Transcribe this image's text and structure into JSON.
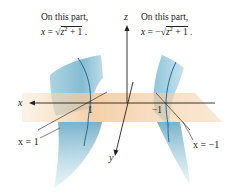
{
  "diagram": {
    "captions": {
      "left": {
        "line1": "On this part,",
        "lhs": "x",
        "eq": " = ",
        "sign": "",
        "radicand_var": "z",
        "radicand_exp": "2",
        "radicand_rest": " + 1",
        "end": " ."
      },
      "right": {
        "line1": "On this part,",
        "lhs": "x",
        "eq": " = ",
        "sign": "−",
        "radicand_var": "z",
        "radicand_exp": "2",
        "radicand_rest": " + 1",
        "end": " ."
      }
    },
    "axes": {
      "x_label": "x",
      "y_label": "y",
      "z_label": "z"
    },
    "ticks": {
      "pos_one": "1",
      "neg_one": "−1"
    },
    "callouts": {
      "left": "x = 1",
      "right": "x = −1"
    },
    "colors": {
      "surface": "#8fc3d6",
      "surface_dark": "#5fa3bf",
      "plane": "#f2c89a",
      "curve": "#1f6e96",
      "axis": "#222222"
    }
  }
}
